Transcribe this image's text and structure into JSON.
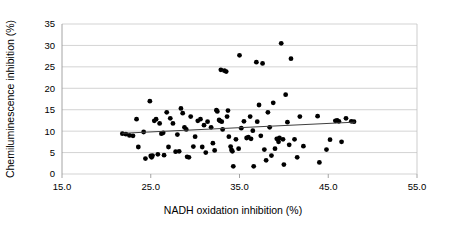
{
  "chart_data": {
    "type": "scatter",
    "title": "",
    "xlabel": "NADH oxidation inhibition  (%)",
    "ylabel": "Chemiluminescence inhibition  (%)",
    "xlim": [
      15.0,
      55.0
    ],
    "ylim": [
      0,
      35
    ],
    "xticks": [
      "15.0",
      "25.0",
      "35.0",
      "45.0",
      "55.0"
    ],
    "xtick_values": [
      15.0,
      25.0,
      35.0,
      45.0,
      55.0
    ],
    "yticks": [
      "0",
      "5",
      "10",
      "15",
      "20",
      "25",
      "30",
      "35"
    ],
    "ytick_values": [
      0,
      5,
      10,
      15,
      20,
      25,
      30,
      35
    ],
    "grid": "horizontal",
    "legend": "none",
    "marker_color": "#000000",
    "marker_size": 2.4,
    "trendline": {
      "color": "#404040",
      "x_start": 21.8,
      "y_start": 9.5,
      "x_end": 48.0,
      "y_end": 12.1
    },
    "points": [
      [
        21.8,
        9.4
      ],
      [
        22.2,
        9.3
      ],
      [
        22.6,
        9.0
      ],
      [
        23.0,
        8.9
      ],
      [
        23.4,
        12.8
      ],
      [
        23.6,
        6.3
      ],
      [
        24.2,
        9.8
      ],
      [
        24.4,
        3.6
      ],
      [
        24.9,
        17.0
      ],
      [
        25.0,
        4.2
      ],
      [
        25.1,
        3.9
      ],
      [
        25.2,
        4.3
      ],
      [
        25.4,
        12.4
      ],
      [
        25.6,
        12.8
      ],
      [
        25.8,
        4.6
      ],
      [
        26.0,
        11.8
      ],
      [
        26.2,
        9.4
      ],
      [
        26.4,
        9.6
      ],
      [
        26.5,
        4.4
      ],
      [
        26.8,
        14.4
      ],
      [
        27.0,
        6.3
      ],
      [
        27.2,
        13.0
      ],
      [
        27.5,
        11.8
      ],
      [
        27.8,
        5.2
      ],
      [
        28.0,
        9.2
      ],
      [
        28.2,
        5.3
      ],
      [
        28.4,
        15.3
      ],
      [
        28.6,
        14.2
      ],
      [
        28.8,
        10.9
      ],
      [
        29.0,
        10.4
      ],
      [
        29.1,
        4.0
      ],
      [
        29.3,
        3.9
      ],
      [
        29.5,
        13.4
      ],
      [
        29.8,
        6.4
      ],
      [
        30.0,
        8.7
      ],
      [
        30.3,
        12.4
      ],
      [
        30.6,
        12.8
      ],
      [
        30.8,
        6.3
      ],
      [
        31.0,
        11.4
      ],
      [
        31.2,
        5.0
      ],
      [
        31.4,
        12.2
      ],
      [
        31.8,
        10.9
      ],
      [
        32.0,
        7.2
      ],
      [
        32.2,
        5.5
      ],
      [
        32.4,
        14.9
      ],
      [
        32.5,
        14.6
      ],
      [
        32.7,
        12.6
      ],
      [
        32.8,
        12.4
      ],
      [
        32.9,
        24.3
      ],
      [
        33.0,
        12.2
      ],
      [
        33.1,
        10.4
      ],
      [
        33.3,
        24.1
      ],
      [
        33.5,
        23.9
      ],
      [
        33.6,
        13.4
      ],
      [
        33.7,
        14.8
      ],
      [
        33.8,
        8.7
      ],
      [
        34.0,
        6.4
      ],
      [
        34.1,
        5.6
      ],
      [
        34.2,
        5.3
      ],
      [
        34.3,
        1.8
      ],
      [
        34.6,
        8.1
      ],
      [
        34.9,
        5.9
      ],
      [
        35.0,
        27.7
      ],
      [
        35.2,
        10.7
      ],
      [
        35.5,
        12.3
      ],
      [
        35.8,
        8.4
      ],
      [
        36.0,
        8.6
      ],
      [
        36.2,
        13.4
      ],
      [
        36.3,
        8.2
      ],
      [
        36.5,
        10.1
      ],
      [
        36.6,
        1.8
      ],
      [
        36.9,
        26.1
      ],
      [
        37.0,
        12.2
      ],
      [
        37.2,
        16.1
      ],
      [
        37.4,
        8.9
      ],
      [
        37.6,
        25.8
      ],
      [
        37.8,
        5.7
      ],
      [
        38.0,
        3.2
      ],
      [
        38.2,
        14.4
      ],
      [
        38.4,
        10.9
      ],
      [
        38.6,
        4.3
      ],
      [
        38.8,
        16.6
      ],
      [
        39.0,
        5.9
      ],
      [
        39.2,
        8.2
      ],
      [
        39.4,
        7.5
      ],
      [
        39.5,
        8.4
      ],
      [
        39.7,
        30.5
      ],
      [
        39.9,
        8.1
      ],
      [
        40.0,
        2.2
      ],
      [
        40.2,
        18.5
      ],
      [
        40.4,
        12.1
      ],
      [
        40.6,
        6.8
      ],
      [
        40.8,
        26.9
      ],
      [
        41.2,
        8.1
      ],
      [
        41.5,
        3.9
      ],
      [
        41.8,
        13.4
      ],
      [
        42.2,
        6.5
      ],
      [
        43.8,
        13.5
      ],
      [
        44.0,
        2.7
      ],
      [
        44.8,
        5.7
      ],
      [
        45.2,
        8.0
      ],
      [
        45.8,
        12.4
      ],
      [
        46.0,
        12.5
      ],
      [
        46.2,
        12.3
      ],
      [
        46.5,
        7.5
      ],
      [
        47.0,
        13.0
      ],
      [
        47.6,
        12.3
      ],
      [
        47.9,
        12.2
      ]
    ]
  },
  "axes": {
    "x_title": "NADH oxidation inhibition  (%)",
    "y_title": "Chemiluminescence inhibition  (%)"
  }
}
